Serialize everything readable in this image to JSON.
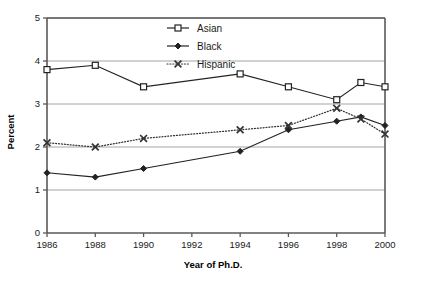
{
  "chart_data": {
    "type": "line",
    "title": "",
    "xlabel": "Year of Ph.D.",
    "ylabel": "Percent",
    "x": [
      1986,
      1988,
      1990,
      1994,
      1996,
      1998,
      1999,
      2000
    ],
    "xlim": [
      1986,
      2000
    ],
    "ylim": [
      0,
      5
    ],
    "xticks": [
      "1986",
      "1988",
      "1990",
      "1992",
      "1994",
      "1996",
      "1998",
      "2000"
    ],
    "xtick_values": [
      1986,
      1988,
      1990,
      1992,
      1994,
      1996,
      1998,
      2000
    ],
    "yticks": [
      "0",
      "1",
      "2",
      "3",
      "4",
      "5"
    ],
    "ytick_values": [
      0,
      1,
      2,
      3,
      4,
      5
    ],
    "grid": "horizontal",
    "legend_position": "top-center",
    "series": [
      {
        "name": "Asian",
        "marker": "open-square",
        "linestyle": "solid",
        "color": "#222222",
        "values": [
          3.8,
          3.9,
          3.4,
          3.7,
          3.4,
          3.1,
          3.5,
          3.4
        ]
      },
      {
        "name": "Black",
        "marker": "filled-diamond",
        "linestyle": "solid",
        "color": "#222222",
        "values": [
          1.4,
          1.3,
          1.5,
          1.9,
          2.4,
          2.6,
          2.7,
          2.5
        ]
      },
      {
        "name": "Hispanic",
        "marker": "cross-x",
        "linestyle": "dotted",
        "color": "#333333",
        "values": [
          2.1,
          2.0,
          2.2,
          2.4,
          2.5,
          2.9,
          2.65,
          2.3
        ]
      }
    ]
  },
  "style": {
    "background": "#ffffff",
    "axis_color": "#595959",
    "grid_color": "#9a9a9a",
    "text_color": "#1a1a1a"
  },
  "legend": {
    "entries": [
      {
        "label": "Asian"
      },
      {
        "label": "Black"
      },
      {
        "label": "Hispanic"
      }
    ]
  }
}
